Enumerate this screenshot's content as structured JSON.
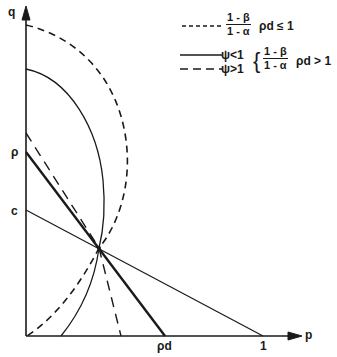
{
  "diagram": {
    "axes": {
      "x_label": "p",
      "y_label": "q"
    },
    "axis_ticks": {
      "y": [
        {
          "label": "ρ"
        },
        {
          "label": "c"
        }
      ],
      "x": [
        {
          "label": "ρd"
        },
        {
          "label": "1"
        }
      ]
    },
    "legend": {
      "entry1": {
        "line_style": "short-dashed",
        "frac_num": "1 - β",
        "frac_den": "1 - α",
        "condition": "ρd ≤ 1"
      },
      "entry2": {
        "solid_label": "ψ<1",
        "dashed_label": "ψ>1",
        "brace": "{",
        "frac_num": "1 - β",
        "frac_den": "1 - α",
        "condition": "ρd > 1"
      }
    },
    "colors": {
      "ink": "#1a1a1a",
      "background": "#ffffff"
    }
  }
}
